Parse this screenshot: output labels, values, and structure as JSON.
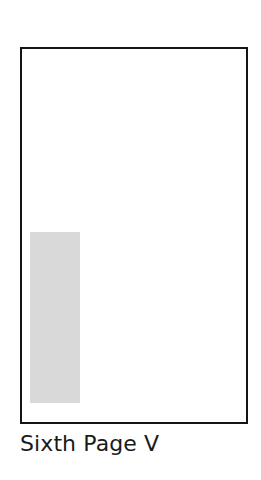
{
  "figure": {
    "caption": "Sixth Page V",
    "background_color": "#ffffff",
    "page": {
      "name": "page-outline",
      "border_color": "#141414",
      "border_width_px": 2,
      "fill_color": "#ffffff",
      "x": 20,
      "y": 47,
      "width": 228,
      "height": 377
    },
    "block": {
      "name": "shaded-content-block",
      "fill_color": "#d9d9d9",
      "x": 30,
      "y": 232,
      "width": 50,
      "height": 171
    }
  }
}
